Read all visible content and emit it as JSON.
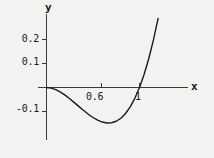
{
  "figure": {
    "background_color": "#f2f2f0",
    "curve_color": "#1a1a1a",
    "axis_color": "#3a3a3a"
  },
  "axis_labels": {
    "x": "x",
    "y": "y"
  },
  "ticks": {
    "y": [
      "0.2",
      "0.1",
      "-0.1"
    ],
    "x": [
      "0.6",
      "1"
    ]
  },
  "chart_data": {
    "type": "line",
    "title": "",
    "xlabel": "x",
    "ylabel": "y",
    "xlim": [
      -0.05,
      1.28
    ],
    "ylim": [
      -0.175,
      0.28
    ],
    "grid": false,
    "legend": null,
    "xticks": [
      0.6,
      1
    ],
    "xticklabels": [
      "0.6",
      "1"
    ],
    "yticks": [
      0.2,
      0.1,
      -0.1
    ],
    "yticklabels": [
      "0.2",
      "0.1",
      "-0.1"
    ],
    "series": [
      {
        "name": "y = x^3 - x^2",
        "x": [
          0.0,
          0.05,
          0.1,
          0.15,
          0.2,
          0.25,
          0.3,
          0.35,
          0.4,
          0.45,
          0.5,
          0.55,
          0.6,
          0.65,
          0.7,
          0.75,
          0.8,
          0.85,
          0.9,
          0.95,
          1.0,
          1.05,
          1.1,
          1.15,
          1.2,
          1.25
        ],
        "y": [
          0.0,
          -0.00238,
          -0.009,
          -0.01913,
          -0.032,
          -0.04688,
          -0.063,
          -0.07963,
          -0.096,
          -0.11138,
          -0.125,
          -0.13613,
          -0.144,
          -0.14788,
          -0.147,
          -0.14063,
          -0.128,
          -0.10838,
          -0.081,
          -0.04513,
          0.0,
          0.05513,
          0.121,
          0.19838,
          0.288,
          0.39063
        ]
      }
    ],
    "annotations": [
      {
        "text": "root at x = 0",
        "x": 0,
        "y": 0
      },
      {
        "text": "root at x = 1",
        "x": 1,
        "y": 0
      },
      {
        "text": "minimum",
        "x": 0.667,
        "y": -0.148
      }
    ]
  }
}
